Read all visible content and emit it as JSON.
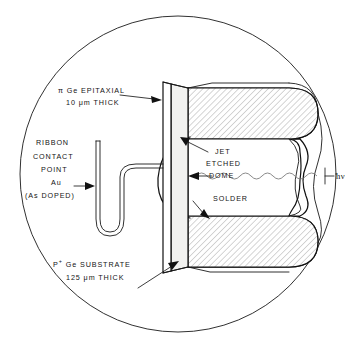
{
  "figure": {
    "name": "germanium-photodiode-cross-section",
    "background_color": "#ffffff",
    "line_color": "#111111",
    "hatch_color": "#a8a8a8",
    "face_color": "#f2f2f0"
  },
  "labels": {
    "epitaxial": {
      "line1": "π Ge EPITAXIAL",
      "line2": "10 μm THICK"
    },
    "ribbon": {
      "line1": "RIBBON",
      "line2": "CONTACT",
      "line3": "POINT",
      "line4": "Au",
      "line5": "(As DOPED)"
    },
    "dome": {
      "line1": "JET",
      "line2": "ETCHED",
      "line3": "DOME"
    },
    "solder": {
      "line1": "SOLDER"
    },
    "substrate": {
      "line1_prefix": "P",
      "line1_sup": "+",
      "line1_rest": " Ge SUBSTRATE",
      "line2": "125 μm THICK"
    },
    "photon": {
      "text": "hν"
    }
  },
  "annotations": {
    "arrow_epitaxial": "arrow pointing right into epitaxial layer",
    "arrow_substrate": "arrow pointing up-right into substrate layer",
    "arrow_dome": "arrow pointing up-right to jet etched dome surface",
    "arrow_solder": "arrow pointing down-right to solder block",
    "arrow_photon": "arrow pointing left indicating incident radiation",
    "wavy_line": "sinusoidal ray representing incident photons"
  }
}
